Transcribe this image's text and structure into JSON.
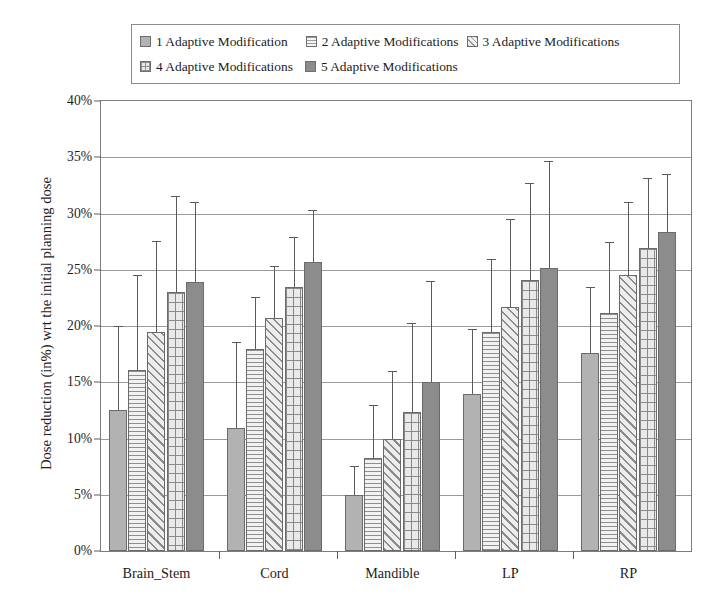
{
  "chart_data": {
    "type": "bar",
    "title": "",
    "xlabel": "",
    "ylabel": "Dose reduction (in%) wrt the initial planning dose",
    "categories": [
      "Brain_Stem",
      "Cord",
      "Mandible",
      "LP",
      "RP"
    ],
    "ylim": [
      0,
      40
    ],
    "ytick_labels": [
      "0%",
      "5%",
      "10%",
      "15%",
      "20%",
      "25%",
      "30%",
      "35%",
      "40%"
    ],
    "ytick_values": [
      0,
      5,
      10,
      15,
      20,
      25,
      30,
      35,
      40
    ],
    "grid": "horizontal",
    "legend_position": "top",
    "error_bars": "upper-only",
    "series": [
      {
        "name": "1 Adaptive Modification",
        "values": [
          12.5,
          10.9,
          5.0,
          14.0,
          17.6
        ],
        "err_upper": [
          20.0,
          18.6,
          7.6,
          19.7,
          23.5
        ],
        "pattern": "solid-light-gray",
        "color": "#b2b2b2"
      },
      {
        "name": "2 Adaptive Modifications",
        "values": [
          16.1,
          18.0,
          8.3,
          19.5,
          21.2
        ],
        "err_upper": [
          24.5,
          22.6,
          13.0,
          26.0,
          27.5
        ],
        "pattern": "horizontal-lines",
        "color": "#f2f2f2"
      },
      {
        "name": "3 Adaptive Modifications",
        "values": [
          19.5,
          20.7,
          10.0,
          21.7,
          24.5
        ],
        "err_upper": [
          27.6,
          25.3,
          16.0,
          29.5,
          31.0
        ],
        "pattern": "diagonal-stripes",
        "color": "#ededed"
      },
      {
        "name": "4 Adaptive Modifications",
        "values": [
          23.0,
          23.5,
          12.4,
          24.1,
          26.9
        ],
        "err_upper": [
          31.6,
          27.9,
          20.3,
          32.7,
          33.2
        ],
        "pattern": "crosshatch-grid",
        "color": "#e9e9e9"
      },
      {
        "name": "5 Adaptive Modifications",
        "values": [
          23.9,
          25.7,
          15.0,
          25.2,
          28.4
        ],
        "err_upper": [
          31.0,
          30.3,
          24.0,
          34.7,
          33.5
        ],
        "pattern": "solid-dark-gray",
        "color": "#8c8c8c"
      }
    ]
  },
  "legend": {
    "items": [
      {
        "label": "1 Adaptive Modification"
      },
      {
        "label": "2 Adaptive Modifications"
      },
      {
        "label": "3 Adaptive Modifications"
      },
      {
        "label": "4 Adaptive Modifications"
      },
      {
        "label": "5 Adaptive Modifications"
      }
    ]
  },
  "axes": {
    "y_title": "Dose reduction (in%) wrt the initial planning dose"
  }
}
